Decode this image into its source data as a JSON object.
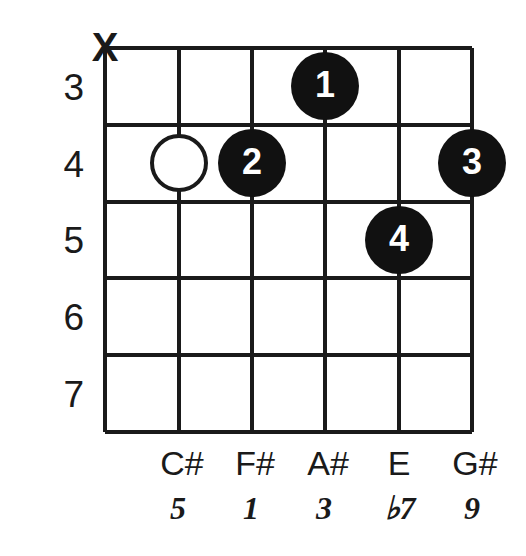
{
  "diagram": {
    "type": "guitar-chord-diagram",
    "string_count": 6,
    "fret_rows": 5,
    "ink_color": "#1a1a1a",
    "dot_fill_color": "#111111",
    "dot_text_color": "#ffffff",
    "background_color": "#ffffff",
    "fret_numbers": [
      {
        "label": "3",
        "row": 0
      },
      {
        "label": "4",
        "row": 1
      },
      {
        "label": "5",
        "row": 2
      },
      {
        "label": "6",
        "row": 3
      },
      {
        "label": "7",
        "row": 4
      }
    ],
    "top_markers": [
      {
        "symbol": "X",
        "string": 1,
        "meaning": "muted-string"
      }
    ],
    "dots": [
      {
        "label": "1",
        "string": 4,
        "fret_row": 0,
        "style": "filled"
      },
      {
        "label": "2",
        "string": 3,
        "fret_row": 1,
        "style": "filled"
      },
      {
        "label": "3",
        "string": 6,
        "fret_row": 1,
        "style": "filled"
      },
      {
        "label": "4",
        "string": 5,
        "fret_row": 2,
        "style": "filled"
      },
      {
        "label": "",
        "string": 2,
        "fret_row": 1,
        "style": "open"
      }
    ],
    "note_names": [
      {
        "string": 2,
        "label": "C#"
      },
      {
        "string": 3,
        "label": "F#"
      },
      {
        "string": 4,
        "label": "A#"
      },
      {
        "string": 5,
        "label": "E"
      },
      {
        "string": 6,
        "label": "G#"
      }
    ],
    "intervals": [
      {
        "string": 2,
        "label": "5"
      },
      {
        "string": 3,
        "label": "1"
      },
      {
        "string": 4,
        "label": "3"
      },
      {
        "string": 5,
        "label": "♭7"
      },
      {
        "string": 6,
        "label": "9"
      }
    ]
  }
}
